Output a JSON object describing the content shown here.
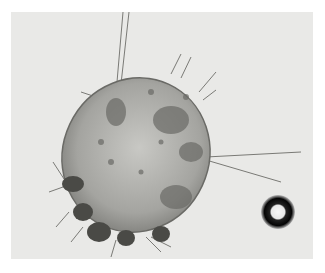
{
  "image": {
    "description": "Grayscale light micrograph of a scabies mite with a round air bubble at lower right",
    "subject": "mite",
    "colors": {
      "background": "#e9e9e7",
      "body": "#a9a9a4",
      "body_dark": "#5e5e5a",
      "setae": "#6f6f6b",
      "bubble_ring": "#0d0d0d",
      "bubble_center": "#f5f5f5"
    }
  }
}
